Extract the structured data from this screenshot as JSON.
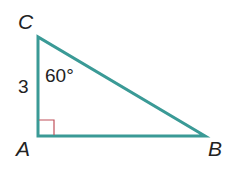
{
  "diagram": {
    "type": "right-triangle",
    "vertices": {
      "A": {
        "label": "A",
        "x": 38,
        "y": 136
      },
      "B": {
        "label": "B",
        "x": 205,
        "y": 136
      },
      "C": {
        "label": "C",
        "x": 38,
        "y": 37
      }
    },
    "side_labels": {
      "AC": "3"
    },
    "angle_labels": {
      "C": "60°"
    },
    "right_angle_at": "A",
    "colors": {
      "stroke": "#3a9a96",
      "right_angle_marker": "#c0505a",
      "text": "#222222"
    }
  }
}
